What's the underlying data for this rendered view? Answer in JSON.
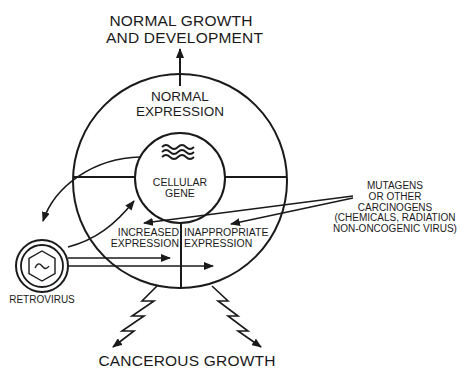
{
  "diagram": {
    "top_outcome": [
      "NORMAL GROWTH",
      "AND DEVELOPMENT"
    ],
    "outer_ring_label": [
      "NORMAL",
      "EXPRESSION"
    ],
    "inner_circle_label": [
      "CELLULAR",
      "GENE"
    ],
    "lower_left_quadrant": [
      "INCREASED",
      "EXPRESSION"
    ],
    "lower_right_quadrant": [
      "INAPPROPRIATE",
      "EXPRESSION"
    ],
    "mutagens_label": [
      "MUTAGENS",
      "OR OTHER",
      "CARCINOGENS",
      "(CHEMICALS, RADIATION",
      "NON-ONCOGENIC VIRUS)"
    ],
    "retrovirus_label": "RETROVIRUS",
    "bottom_outcome": "CANCEROUS GROWTH",
    "colors": {
      "ink": "#1a1a1a",
      "background": "#ffffff"
    },
    "icons": {
      "gene": "wavy-lines-icon",
      "retrovirus": "hexagon-virus-icon"
    }
  }
}
